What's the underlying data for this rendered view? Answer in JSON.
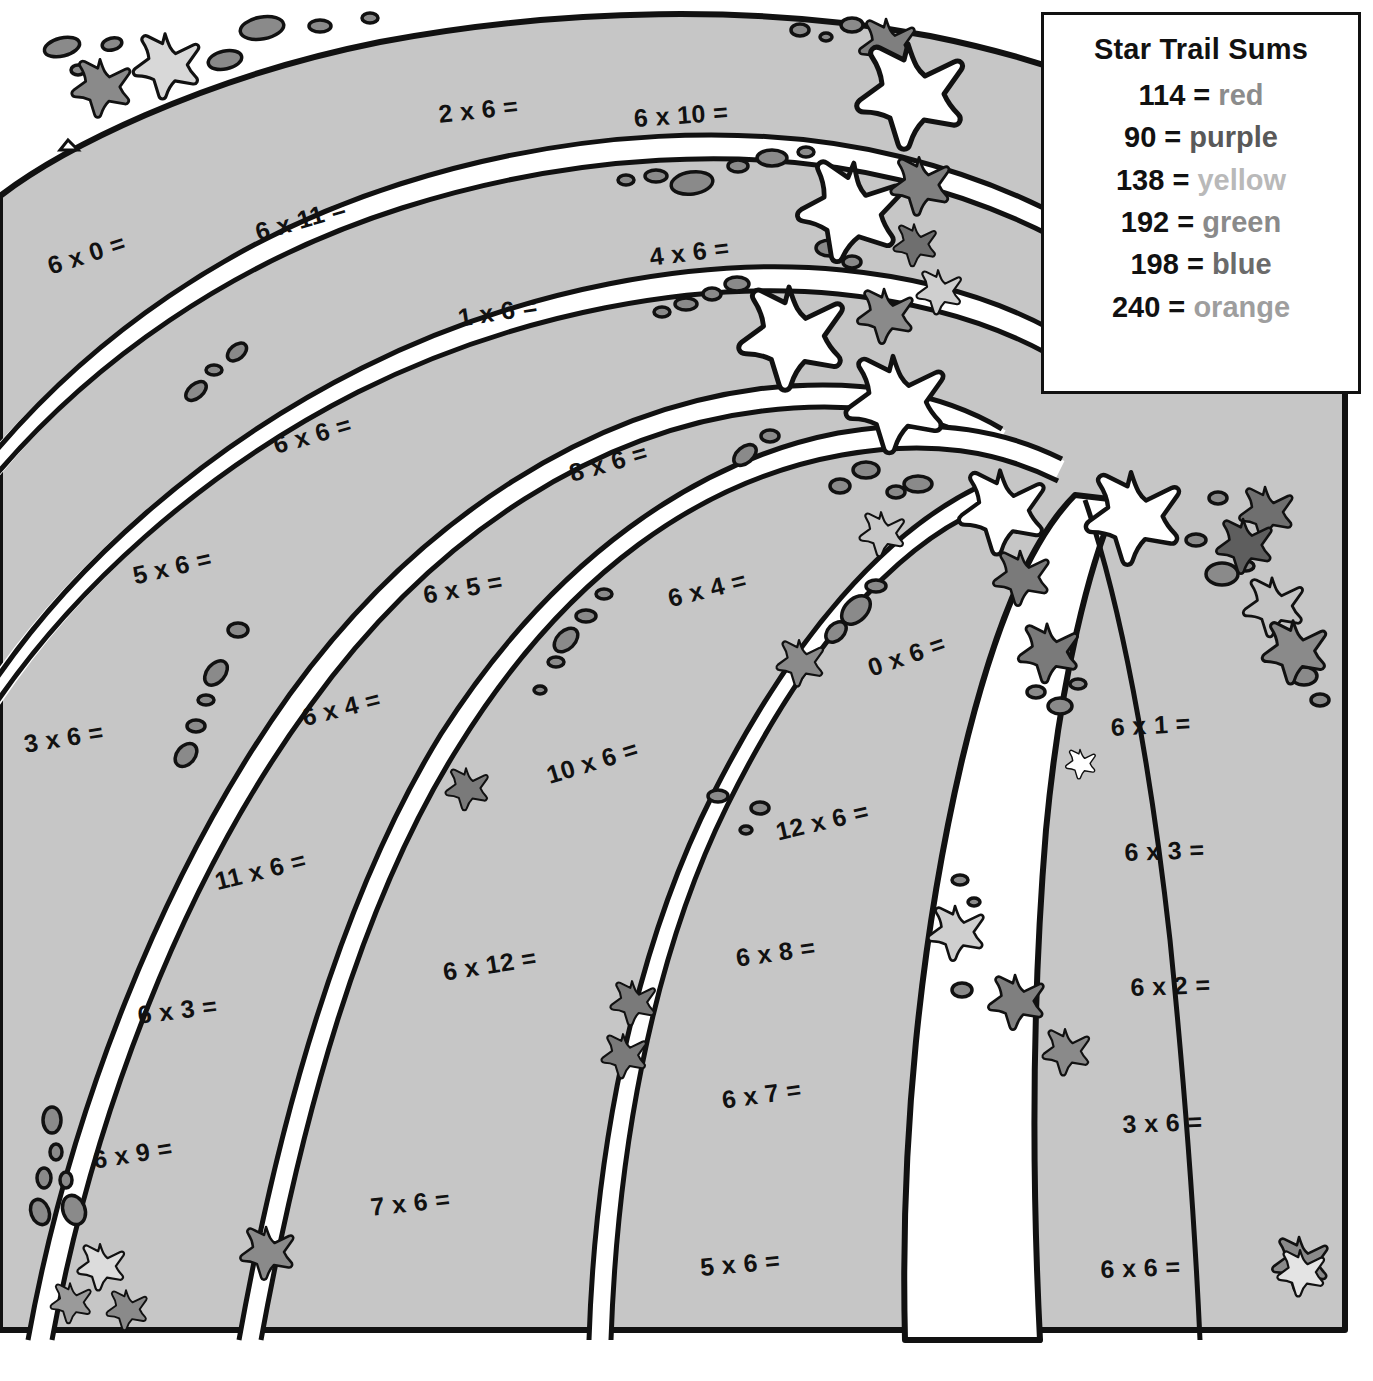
{
  "worksheet": {
    "title_hidden": "",
    "band_fill": "#c6c6c6",
    "trail_fill": "#ffffff",
    "ink": "#111111"
  },
  "legend": {
    "title": "Star Trail Sums",
    "rows": [
      {
        "sum": "114",
        "eq": "=",
        "color_name": "red",
        "swatch": "#8c8c8c"
      },
      {
        "sum": "90",
        "eq": "=",
        "color_name": "purple",
        "swatch": "#595959"
      },
      {
        "sum": "138",
        "eq": "=",
        "color_name": "yellow",
        "swatch": "#b9b9b9"
      },
      {
        "sum": "192",
        "eq": "=",
        "color_name": "green",
        "swatch": "#8a8a8a"
      },
      {
        "sum": "198",
        "eq": "=",
        "color_name": "blue",
        "swatch": "#6b6b6b"
      },
      {
        "sum": "240",
        "eq": "=",
        "color_name": "orange",
        "swatch": "#9e9e9e"
      }
    ]
  },
  "problems": [
    {
      "text": "2 x 6 =",
      "x": 437,
      "y": 100,
      "rot": -6
    },
    {
      "text": "6 x 10 =",
      "x": 633,
      "y": 104,
      "rot": -4
    },
    {
      "text": "6 x 0 =",
      "x": 44,
      "y": 253,
      "rot": -18
    },
    {
      "text": "6 x 11 =",
      "x": 252,
      "y": 219,
      "rot": -16
    },
    {
      "text": "4 x 6 =",
      "x": 648,
      "y": 243,
      "rot": -7
    },
    {
      "text": "1 x 6 =",
      "x": 456,
      "y": 304,
      "rot": -9
    },
    {
      "text": "6 x 6 =",
      "x": 270,
      "y": 432,
      "rot": -16
    },
    {
      "text": "8 x 6 =",
      "x": 566,
      "y": 460,
      "rot": -16
    },
    {
      "text": "5 x 6 =",
      "x": 130,
      "y": 562,
      "rot": -13
    },
    {
      "text": "6 x 5 =",
      "x": 421,
      "y": 581,
      "rot": -10
    },
    {
      "text": "6 x 4 =",
      "x": 665,
      "y": 585,
      "rot": -14
    },
    {
      "text": "0 x 6 =",
      "x": 864,
      "y": 655,
      "rot": -19
    },
    {
      "text": "3 x 6 =",
      "x": 22,
      "y": 730,
      "rot": -9
    },
    {
      "text": "6 x 4 =",
      "x": 299,
      "y": 704,
      "rot": -14
    },
    {
      "text": "6 x 1 =",
      "x": 1110,
      "y": 713,
      "rot": -3
    },
    {
      "text": "10 x 6 =",
      "x": 543,
      "y": 762,
      "rot": -17
    },
    {
      "text": "12 x 6 =",
      "x": 773,
      "y": 818,
      "rot": -13
    },
    {
      "text": "11 x 6 =",
      "x": 212,
      "y": 868,
      "rot": -14
    },
    {
      "text": "6 x 3 =",
      "x": 1124,
      "y": 838,
      "rot": -2
    },
    {
      "text": "6 x 12 =",
      "x": 441,
      "y": 958,
      "rot": -9
    },
    {
      "text": "6 x 8 =",
      "x": 734,
      "y": 944,
      "rot": -8
    },
    {
      "text": "6 x 3 =",
      "x": 136,
      "y": 1001,
      "rot": -7
    },
    {
      "text": "6 x 2 =",
      "x": 1130,
      "y": 973,
      "rot": -2
    },
    {
      "text": "6 x 7 =",
      "x": 720,
      "y": 1086,
      "rot": -8
    },
    {
      "text": "3 x 6 =",
      "x": 1122,
      "y": 1110,
      "rot": -2
    },
    {
      "text": "6 x 9 =",
      "x": 91,
      "y": 1146,
      "rot": -9
    },
    {
      "text": "7 x 6 =",
      "x": 369,
      "y": 1193,
      "rot": -6
    },
    {
      "text": "5 x 6 =",
      "x": 699,
      "y": 1253,
      "rot": -5
    },
    {
      "text": "6 x 6 =",
      "x": 1100,
      "y": 1255,
      "rot": -2
    }
  ]
}
